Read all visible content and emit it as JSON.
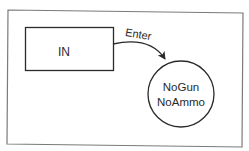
{
  "diagram": {
    "type": "state-diagram",
    "states": [
      {
        "id": "in",
        "label": "IN",
        "shape": "rectangle"
      },
      {
        "id": "nogun-noammo",
        "label_lines": [
          "NoGun",
          "NoAmmo"
        ],
        "shape": "circle"
      }
    ],
    "transitions": [
      {
        "from": "in",
        "to": "nogun-noammo",
        "label": "Enter"
      }
    ],
    "colors": {
      "stroke": "#2a2a2a",
      "frame": "#777777",
      "background": "#ffffff"
    }
  }
}
